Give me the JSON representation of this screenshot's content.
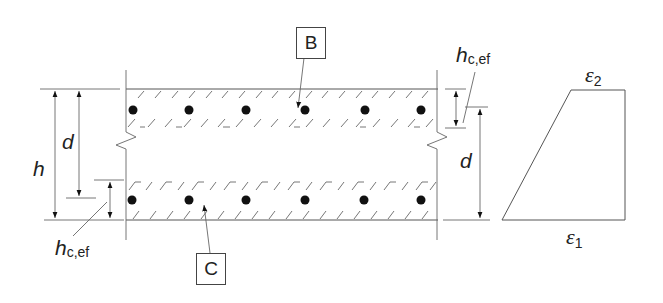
{
  "figure": {
    "labels": {
      "h": "h",
      "d_left": "d",
      "d_right": "d",
      "hcef_top_main": "h",
      "hcef_top_sub": "c,ef",
      "hcef_bottom_main": "h",
      "hcef_bottom_sub": "c,ef",
      "box_B": "B",
      "box_C": "C",
      "eps2_main": "ε",
      "eps2_sub": "2",
      "eps1_main": "ε",
      "eps1_sub": "1"
    },
    "colors": {
      "line": "#555555",
      "bar": "#111111",
      "text": "#222222"
    },
    "section": {
      "top_rebar_count": 6,
      "bottom_rebar_count": 6
    }
  }
}
